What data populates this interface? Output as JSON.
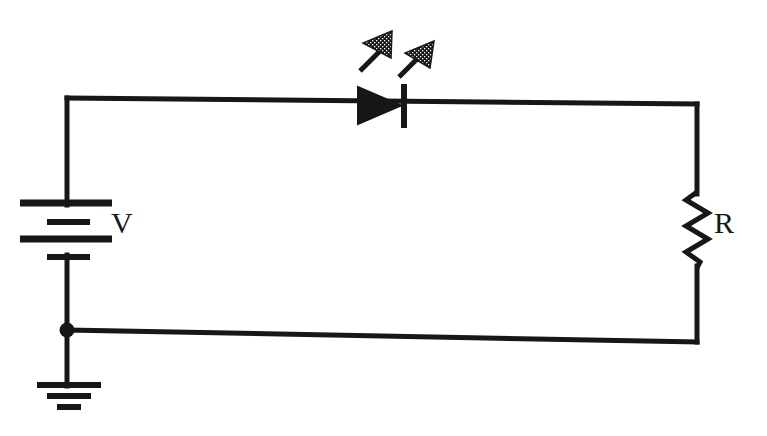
{
  "diagram": {
    "background_color": "#ffffff",
    "stroke_color": "#171717",
    "canvas": {
      "width": 767,
      "height": 436
    }
  },
  "components": {
    "battery": {
      "name": "battery",
      "label": "V",
      "symbol": "dc-voltage-source",
      "cells": 2,
      "plates": [
        {
          "type": "long",
          "y": 203,
          "x1": 20,
          "x2": 112
        },
        {
          "type": "short",
          "y": 222,
          "x1": 47,
          "x2": 90
        },
        {
          "type": "long",
          "y": 239,
          "x1": 20,
          "x2": 112
        },
        {
          "type": "short",
          "y": 257,
          "x1": 47,
          "x2": 90
        }
      ]
    },
    "led": {
      "name": "light-emitting-diode",
      "label": "",
      "symbol": "led",
      "anode_direction": "left",
      "cathode_bar_x": 404,
      "triangle": {
        "x1": 358,
        "x2": 401,
        "y_top": 87,
        "y_bottom": 124
      },
      "emission_arrows": 2,
      "emission_direction": "up-right"
    },
    "resistor": {
      "name": "resistor",
      "label": "R",
      "symbol": "zigzag-resistor",
      "zigzag_peaks": 6,
      "y_top": 192,
      "y_bottom": 268,
      "center_x": 697,
      "amplitude": 12
    },
    "ground": {
      "name": "ground",
      "label": "",
      "symbol": "earth-ground",
      "bars": [
        {
          "y": 385,
          "x1": 37,
          "x2": 101
        },
        {
          "y": 396,
          "x1": 47,
          "x2": 91
        },
        {
          "y": 407,
          "x1": 57,
          "x2": 81
        }
      ]
    },
    "junction": {
      "name": "junction-node",
      "x": 67,
      "y": 330,
      "radius": 7
    }
  },
  "wires": [
    {
      "name": "top-wire",
      "x1": 67,
      "y1": 98,
      "x2": 697,
      "y2": 104
    },
    {
      "name": "left-upper-wire",
      "x1": 67,
      "y1": 98,
      "x2": 67,
      "y2": 203
    },
    {
      "name": "left-lower-wire",
      "x1": 67,
      "y1": 257,
      "x2": 67,
      "y2": 330
    },
    {
      "name": "bottom-wire",
      "x1": 67,
      "y1": 330,
      "x2": 697,
      "y2": 342
    },
    {
      "name": "ground-stem",
      "x1": 67,
      "y1": 330,
      "x2": 67,
      "y2": 385
    },
    {
      "name": "right-upper-wire",
      "x1": 697,
      "y1": 104,
      "x2": 697,
      "y2": 192
    },
    {
      "name": "right-lower-wire",
      "x1": 697,
      "y1": 268,
      "x2": 697,
      "y2": 342
    }
  ]
}
